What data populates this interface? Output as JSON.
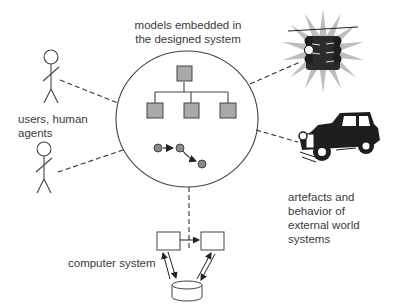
{
  "labels": {
    "models": [
      "models embedded in",
      "the designed system"
    ],
    "users": [
      "users, human",
      "agents"
    ],
    "external": [
      "artefacts and",
      "behavior of",
      "external world",
      "systems"
    ],
    "computer": "computer system"
  },
  "colors": {
    "line": "#444444",
    "model_box": "#a9a9a9",
    "state_node": "#8a8a8a",
    "traffic_glow": "#bdbdbd",
    "dark": "#1e1e1e"
  },
  "icons": [
    "stick-figure-icon",
    "stick-figure-icon",
    "traffic-light-icon",
    "vintage-car-icon",
    "database-icon"
  ]
}
